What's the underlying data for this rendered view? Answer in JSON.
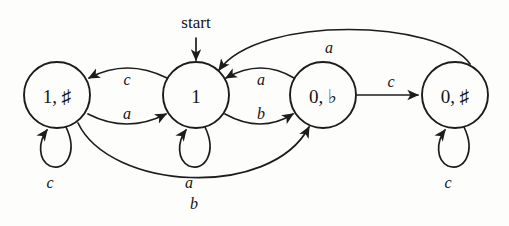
{
  "diagram": {
    "kind": "finite-state-automaton",
    "start_label": "start",
    "states": [
      {
        "id": "s1",
        "label": "1, ♯",
        "cx": 57,
        "cy": 95,
        "r": 33
      },
      {
        "id": "s2",
        "label": "1",
        "cx": 196,
        "cy": 95,
        "r": 33
      },
      {
        "id": "s3",
        "label": "0, ♭",
        "cx": 323,
        "cy": 95,
        "r": 33
      },
      {
        "id": "s4",
        "label": "0, ♯",
        "cx": 455,
        "cy": 95,
        "r": 33
      }
    ],
    "transitions": [
      {
        "from": "s2",
        "to": "s1",
        "symbol": "c",
        "shape": "arc-above",
        "lx": 127,
        "ly": 79
      },
      {
        "from": "s1",
        "to": "s2",
        "symbol": "a",
        "shape": "arc-below",
        "lx": 127,
        "ly": 113
      },
      {
        "from": "s3",
        "to": "s2",
        "symbol": "a",
        "shape": "arc-above",
        "lx": 261,
        "ly": 79
      },
      {
        "from": "s2",
        "to": "s3",
        "symbol": "b",
        "shape": "arc-below",
        "lx": 261,
        "ly": 113
      },
      {
        "from": "s3",
        "to": "s4",
        "symbol": "c",
        "shape": "straight",
        "lx": 391,
        "ly": 81
      },
      {
        "from": "s4",
        "to": "s2",
        "symbol": "a",
        "shape": "long-arc-top",
        "lx": 329,
        "ly": 47
      },
      {
        "from": "s1",
        "to": "s3",
        "symbol": "b",
        "shape": "long-arc-bottom",
        "lx": 194,
        "ly": 203
      },
      {
        "from": "s1",
        "to": "s1",
        "symbol": "c",
        "shape": "self-loop",
        "lx": 50,
        "ly": 182
      },
      {
        "from": "s2",
        "to": "s2",
        "symbol": "a",
        "shape": "self-loop",
        "lx": 189,
        "ly": 182
      },
      {
        "from": "s4",
        "to": "s4",
        "symbol": "c",
        "shape": "self-loop",
        "lx": 448,
        "ly": 182
      }
    ],
    "colors": {
      "ink": "#1c1c1c",
      "paper": "#fdfdfc"
    }
  }
}
